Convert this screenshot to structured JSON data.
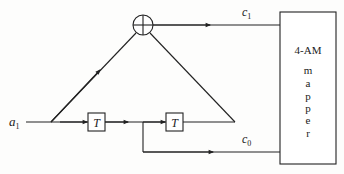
{
  "diagram": {
    "input": {
      "symbol": "a",
      "subscript": "1"
    },
    "delays": [
      {
        "label": "T"
      },
      {
        "label": "T"
      }
    ],
    "adder": {
      "symbol": "modulo-2 adder"
    },
    "outputs": [
      {
        "symbol": "c",
        "subscript": "1"
      },
      {
        "symbol": "c",
        "subscript": "0"
      }
    ],
    "mapper": {
      "title": "4-AM",
      "letters": [
        "m",
        "a",
        "p",
        "p",
        "e",
        "r"
      ]
    },
    "colors": {
      "line": "#222222",
      "background": "#fdfdfc"
    }
  }
}
